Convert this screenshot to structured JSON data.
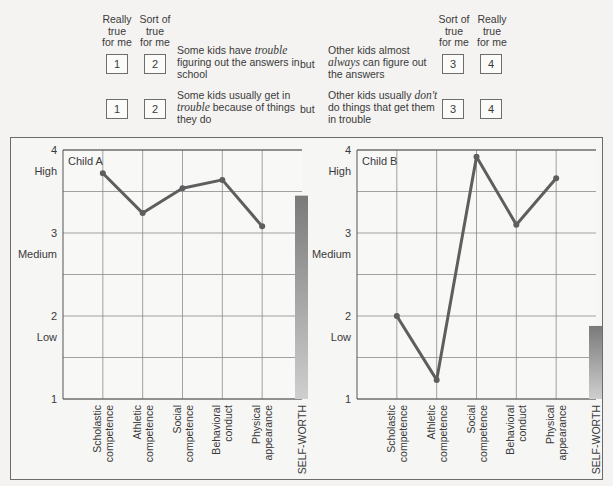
{
  "questionnaire": {
    "left_headers": [
      {
        "lines": [
          "Really",
          "true",
          "for me"
        ]
      },
      {
        "lines": [
          "Sort of",
          "true",
          "for me"
        ]
      }
    ],
    "right_headers": [
      {
        "lines": [
          "Sort of",
          "true",
          "for me"
        ]
      },
      {
        "lines": [
          "Really",
          "true",
          "for me"
        ]
      }
    ],
    "items": [
      {
        "left_boxes": [
          "1",
          "2"
        ],
        "left_text": {
          "pre": "Some kids have ",
          "em": "trouble",
          "post": " figuring out the answers in school"
        },
        "connector": "but",
        "right_text": {
          "pre": "Other kids almost ",
          "em": "always",
          "post": " can figure out the answers"
        },
        "right_boxes": [
          "3",
          "4"
        ]
      },
      {
        "left_boxes": [
          "1",
          "2"
        ],
        "left_text": {
          "pre": "Some kids usually get in ",
          "em": "trouble",
          "post": " because of things they do"
        },
        "connector": "but",
        "right_text": {
          "pre": "Other kids usually ",
          "em": "don't",
          "post": " do things that get them in trouble"
        },
        "right_boxes": [
          "3",
          "4"
        ]
      }
    ]
  },
  "chart_data": [
    {
      "type": "line",
      "title": "Child A",
      "categories": [
        "Scholastic competence",
        "Athletic competence",
        "Social competence",
        "Behavioral conduct",
        "Physical appearance"
      ],
      "values": [
        3.72,
        3.24,
        3.54,
        3.64,
        3.08
      ],
      "bar": {
        "label": "SELF-WORTH",
        "value": 3.45
      },
      "ylim": [
        1,
        4
      ],
      "yticks": [
        "1",
        "2",
        "3",
        "4"
      ],
      "ylevel_labels": [
        {
          "label": "Low",
          "y": 1.75
        },
        {
          "label": "Medium",
          "y": 2.75
        },
        {
          "label": "High",
          "y": 3.75
        }
      ],
      "grid": true
    },
    {
      "type": "line",
      "title": "Child B",
      "categories": [
        "Scholastic competence",
        "Athletic competence",
        "Social competence",
        "Behavioral conduct",
        "Physical appearance"
      ],
      "values": [
        2.0,
        1.23,
        3.92,
        3.1,
        3.66
      ],
      "bar": {
        "label": "SELF-WORTH",
        "value": 1.88
      },
      "ylim": [
        1,
        4
      ],
      "yticks": [
        "1",
        "2",
        "3",
        "4"
      ],
      "ylevel_labels": [
        {
          "label": "Low",
          "y": 1.75
        },
        {
          "label": "Medium",
          "y": 2.75
        },
        {
          "label": "High",
          "y": 3.75
        }
      ],
      "grid": true
    }
  ],
  "colors": {
    "line": "#5e5e5e",
    "grid": "#8a8a8a",
    "bar_top": "#7a7a7a",
    "bar_bottom": "#cfcfcf",
    "frame": "#6b6b6b"
  }
}
